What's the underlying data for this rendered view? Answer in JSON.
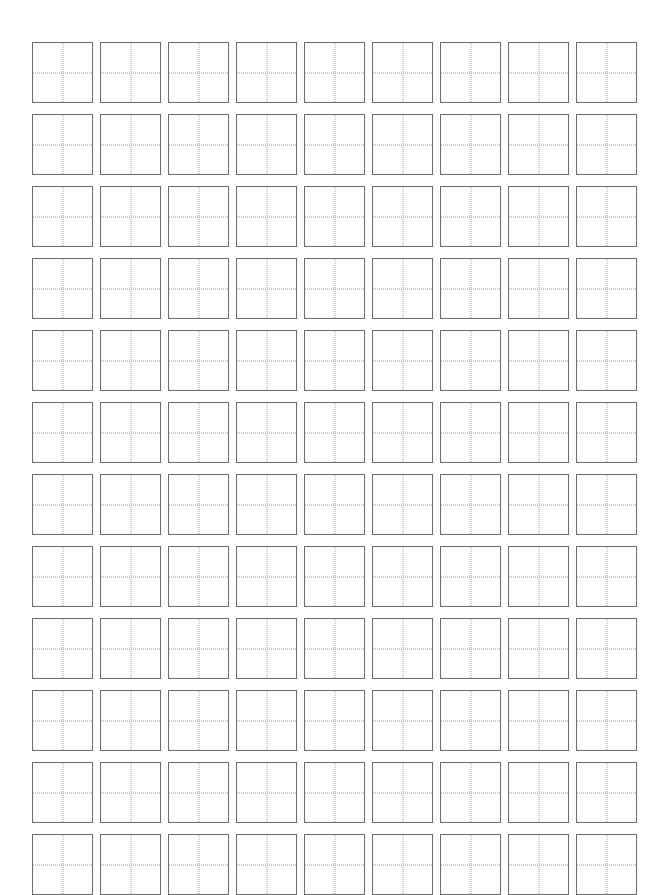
{
  "page": {
    "kind": "practice-grid-worksheet",
    "title": "",
    "footer": "",
    "background_color": "#ffffff",
    "width": 664,
    "height": 895
  },
  "grid": {
    "columns": 9,
    "rows": 12,
    "total_cells": 108,
    "cell_size_px": 61,
    "column_gap_px": 7,
    "row_gap_px": 11,
    "origin_x_px": 32,
    "origin_y_px": 42,
    "border_color": "#6b6b6b",
    "border_width_px": 1.5,
    "guide_color": "#9a9a9a",
    "guide_style": "dotted",
    "guides": [
      "vertical-center",
      "horizontal-center"
    ]
  },
  "cells": [
    {
      "row": 1,
      "col": 1,
      "glyph": ""
    },
    {
      "row": 1,
      "col": 2,
      "glyph": ""
    },
    {
      "row": 1,
      "col": 3,
      "glyph": ""
    },
    {
      "row": 1,
      "col": 4,
      "glyph": ""
    },
    {
      "row": 1,
      "col": 5,
      "glyph": ""
    },
    {
      "row": 1,
      "col": 6,
      "glyph": ""
    },
    {
      "row": 1,
      "col": 7,
      "glyph": ""
    },
    {
      "row": 1,
      "col": 8,
      "glyph": ""
    },
    {
      "row": 1,
      "col": 9,
      "glyph": ""
    },
    {
      "row": 2,
      "col": 1,
      "glyph": ""
    },
    {
      "row": 2,
      "col": 2,
      "glyph": ""
    },
    {
      "row": 2,
      "col": 3,
      "glyph": ""
    },
    {
      "row": 2,
      "col": 4,
      "glyph": ""
    },
    {
      "row": 2,
      "col": 5,
      "glyph": ""
    },
    {
      "row": 2,
      "col": 6,
      "glyph": ""
    },
    {
      "row": 2,
      "col": 7,
      "glyph": ""
    },
    {
      "row": 2,
      "col": 8,
      "glyph": ""
    },
    {
      "row": 2,
      "col": 9,
      "glyph": ""
    },
    {
      "row": 3,
      "col": 1,
      "glyph": ""
    },
    {
      "row": 3,
      "col": 2,
      "glyph": ""
    },
    {
      "row": 3,
      "col": 3,
      "glyph": ""
    },
    {
      "row": 3,
      "col": 4,
      "glyph": ""
    },
    {
      "row": 3,
      "col": 5,
      "glyph": ""
    },
    {
      "row": 3,
      "col": 6,
      "glyph": ""
    },
    {
      "row": 3,
      "col": 7,
      "glyph": ""
    },
    {
      "row": 3,
      "col": 8,
      "glyph": ""
    },
    {
      "row": 3,
      "col": 9,
      "glyph": ""
    },
    {
      "row": 4,
      "col": 1,
      "glyph": ""
    },
    {
      "row": 4,
      "col": 2,
      "glyph": ""
    },
    {
      "row": 4,
      "col": 3,
      "glyph": ""
    },
    {
      "row": 4,
      "col": 4,
      "glyph": ""
    },
    {
      "row": 4,
      "col": 5,
      "glyph": ""
    },
    {
      "row": 4,
      "col": 6,
      "glyph": ""
    },
    {
      "row": 4,
      "col": 7,
      "glyph": ""
    },
    {
      "row": 4,
      "col": 8,
      "glyph": ""
    },
    {
      "row": 4,
      "col": 9,
      "glyph": ""
    },
    {
      "row": 5,
      "col": 1,
      "glyph": ""
    },
    {
      "row": 5,
      "col": 2,
      "glyph": ""
    },
    {
      "row": 5,
      "col": 3,
      "glyph": ""
    },
    {
      "row": 5,
      "col": 4,
      "glyph": ""
    },
    {
      "row": 5,
      "col": 5,
      "glyph": ""
    },
    {
      "row": 5,
      "col": 6,
      "glyph": ""
    },
    {
      "row": 5,
      "col": 7,
      "glyph": ""
    },
    {
      "row": 5,
      "col": 8,
      "glyph": ""
    },
    {
      "row": 5,
      "col": 9,
      "glyph": ""
    },
    {
      "row": 6,
      "col": 1,
      "glyph": ""
    },
    {
      "row": 6,
      "col": 2,
      "glyph": ""
    },
    {
      "row": 6,
      "col": 3,
      "glyph": ""
    },
    {
      "row": 6,
      "col": 4,
      "glyph": ""
    },
    {
      "row": 6,
      "col": 5,
      "glyph": ""
    },
    {
      "row": 6,
      "col": 6,
      "glyph": ""
    },
    {
      "row": 6,
      "col": 7,
      "glyph": ""
    },
    {
      "row": 6,
      "col": 8,
      "glyph": ""
    },
    {
      "row": 6,
      "col": 9,
      "glyph": ""
    },
    {
      "row": 7,
      "col": 1,
      "glyph": ""
    },
    {
      "row": 7,
      "col": 2,
      "glyph": ""
    },
    {
      "row": 7,
      "col": 3,
      "glyph": ""
    },
    {
      "row": 7,
      "col": 4,
      "glyph": ""
    },
    {
      "row": 7,
      "col": 5,
      "glyph": ""
    },
    {
      "row": 7,
      "col": 6,
      "glyph": ""
    },
    {
      "row": 7,
      "col": 7,
      "glyph": ""
    },
    {
      "row": 7,
      "col": 8,
      "glyph": ""
    },
    {
      "row": 7,
      "col": 9,
      "glyph": ""
    },
    {
      "row": 8,
      "col": 1,
      "glyph": ""
    },
    {
      "row": 8,
      "col": 2,
      "glyph": ""
    },
    {
      "row": 8,
      "col": 3,
      "glyph": ""
    },
    {
      "row": 8,
      "col": 4,
      "glyph": ""
    },
    {
      "row": 8,
      "col": 5,
      "glyph": ""
    },
    {
      "row": 8,
      "col": 6,
      "glyph": ""
    },
    {
      "row": 8,
      "col": 7,
      "glyph": ""
    },
    {
      "row": 8,
      "col": 8,
      "glyph": ""
    },
    {
      "row": 8,
      "col": 9,
      "glyph": ""
    },
    {
      "row": 9,
      "col": 1,
      "glyph": ""
    },
    {
      "row": 9,
      "col": 2,
      "glyph": ""
    },
    {
      "row": 9,
      "col": 3,
      "glyph": ""
    },
    {
      "row": 9,
      "col": 4,
      "glyph": ""
    },
    {
      "row": 9,
      "col": 5,
      "glyph": ""
    },
    {
      "row": 9,
      "col": 6,
      "glyph": ""
    },
    {
      "row": 9,
      "col": 7,
      "glyph": ""
    },
    {
      "row": 9,
      "col": 8,
      "glyph": ""
    },
    {
      "row": 9,
      "col": 9,
      "glyph": ""
    },
    {
      "row": 10,
      "col": 1,
      "glyph": ""
    },
    {
      "row": 10,
      "col": 2,
      "glyph": ""
    },
    {
      "row": 10,
      "col": 3,
      "glyph": ""
    },
    {
      "row": 10,
      "col": 4,
      "glyph": ""
    },
    {
      "row": 10,
      "col": 5,
      "glyph": ""
    },
    {
      "row": 10,
      "col": 6,
      "glyph": ""
    },
    {
      "row": 10,
      "col": 7,
      "glyph": ""
    },
    {
      "row": 10,
      "col": 8,
      "glyph": ""
    },
    {
      "row": 10,
      "col": 9,
      "glyph": ""
    },
    {
      "row": 11,
      "col": 1,
      "glyph": ""
    },
    {
      "row": 11,
      "col": 2,
      "glyph": ""
    },
    {
      "row": 11,
      "col": 3,
      "glyph": ""
    },
    {
      "row": 11,
      "col": 4,
      "glyph": ""
    },
    {
      "row": 11,
      "col": 5,
      "glyph": ""
    },
    {
      "row": 11,
      "col": 6,
      "glyph": ""
    },
    {
      "row": 11,
      "col": 7,
      "glyph": ""
    },
    {
      "row": 11,
      "col": 8,
      "glyph": ""
    },
    {
      "row": 11,
      "col": 9,
      "glyph": ""
    },
    {
      "row": 12,
      "col": 1,
      "glyph": ""
    },
    {
      "row": 12,
      "col": 2,
      "glyph": ""
    },
    {
      "row": 12,
      "col": 3,
      "glyph": ""
    },
    {
      "row": 12,
      "col": 4,
      "glyph": ""
    },
    {
      "row": 12,
      "col": 5,
      "glyph": ""
    },
    {
      "row": 12,
      "col": 6,
      "glyph": ""
    },
    {
      "row": 12,
      "col": 7,
      "glyph": ""
    },
    {
      "row": 12,
      "col": 8,
      "glyph": ""
    },
    {
      "row": 12,
      "col": 9,
      "glyph": ""
    }
  ]
}
